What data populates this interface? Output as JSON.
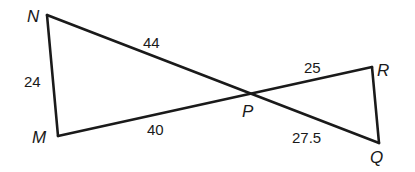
{
  "diagram": {
    "type": "geometry-bowtie-triangles",
    "vertices": {
      "N": {
        "label": "N",
        "x": 47,
        "y": 15
      },
      "M": {
        "label": "M",
        "x": 58,
        "y": 136
      },
      "P": {
        "label": "P",
        "x": 252,
        "y": 95
      },
      "R": {
        "label": "R",
        "x": 372,
        "y": 67
      },
      "Q": {
        "label": "Q",
        "x": 379,
        "y": 143
      }
    },
    "segments": [
      {
        "id": "NP",
        "from": "N",
        "to": "P",
        "length_label": "44"
      },
      {
        "id": "NM",
        "from": "N",
        "to": "M",
        "length_label": "24"
      },
      {
        "id": "MP",
        "from": "M",
        "to": "P",
        "length_label": "40"
      },
      {
        "id": "PR",
        "from": "P",
        "to": "R",
        "length_label": "25"
      },
      {
        "id": "PQ",
        "from": "P",
        "to": "Q",
        "length_label": "27.5"
      },
      {
        "id": "RQ",
        "from": "R",
        "to": "Q",
        "length_label": ""
      }
    ],
    "triangles": [
      "NMP",
      "RQP"
    ],
    "line_color": "#1a1a1a"
  }
}
